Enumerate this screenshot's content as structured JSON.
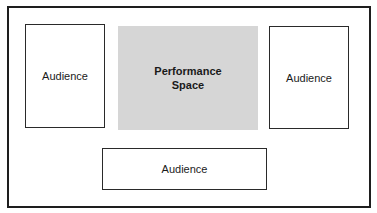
{
  "diagram": {
    "type": "stage-layout",
    "performance_space": {
      "label_line1": "Performance",
      "label_line2": "Space",
      "fill": "#d6d6d6"
    },
    "audience_left": {
      "label": "Audience"
    },
    "audience_right": {
      "label": "Audience"
    },
    "audience_bottom": {
      "label": "Audience"
    },
    "colors": {
      "border": "#1e1e1e",
      "background": "#ffffff"
    }
  }
}
